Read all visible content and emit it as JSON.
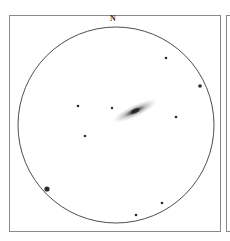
{
  "sketch": {
    "orientation_label": "N",
    "field_of_view": {
      "cx": 116,
      "cy": 125,
      "r": 98,
      "stroke": "#3a3a3a"
    },
    "galaxy": {
      "cx": 135,
      "cy": 111,
      "rx": 26,
      "ry": 6.5,
      "angle": -25,
      "core_color": "#222222",
      "halo_color": "#9a9a9a"
    },
    "stars": [
      {
        "x": 78,
        "y": 106,
        "r": 1.3
      },
      {
        "x": 112,
        "y": 108,
        "r": 1.2
      },
      {
        "x": 85,
        "y": 136,
        "r": 1.3
      },
      {
        "x": 166,
        "y": 58,
        "r": 1.3
      },
      {
        "x": 200,
        "y": 86,
        "r": 1.8
      },
      {
        "x": 176,
        "y": 117,
        "r": 1.3
      },
      {
        "x": 47,
        "y": 189,
        "r": 2.6
      },
      {
        "x": 162,
        "y": 203,
        "r": 1.3
      },
      {
        "x": 136,
        "y": 215,
        "r": 1.3
      }
    ]
  }
}
